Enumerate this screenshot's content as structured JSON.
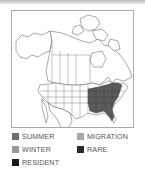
{
  "map": {
    "region": "North America",
    "highlighted_range": "Southeastern United States",
    "highlight_category": "RESIDENT",
    "colors": {
      "border": "#a9a9a9",
      "outline": "#555555",
      "land": "#ffffff",
      "range_fill": "#5a5a5a"
    }
  },
  "legend": {
    "items": [
      {
        "label": "SUMMER",
        "color": "#6e6e6e"
      },
      {
        "label": "MIGRATION",
        "color": "#a8a8a8"
      },
      {
        "label": "WINTER",
        "color": "#9a9a9a"
      },
      {
        "label": "RARE",
        "color": "#2a2a2a"
      },
      {
        "label": "RESIDENT",
        "color": "#1a1a1a"
      }
    ]
  }
}
